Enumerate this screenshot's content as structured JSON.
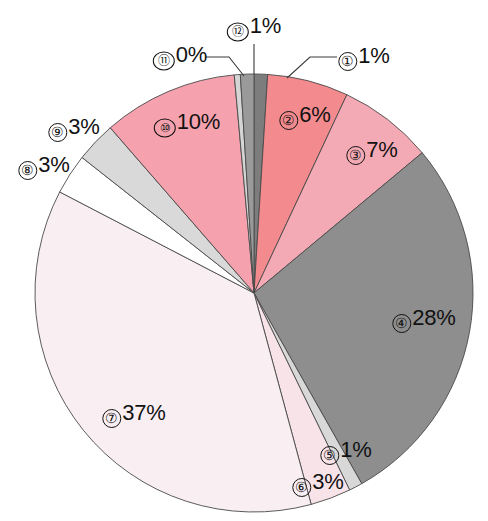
{
  "chart_data": {
    "type": "pie",
    "title": "",
    "subtitle": "",
    "xlabel": "",
    "ylabel": "",
    "legend_position": "none",
    "grid": false,
    "unit": "%",
    "start_angle_deg": -90,
    "direction": "clockwise",
    "categories": [
      "1",
      "2",
      "3",
      "4",
      "5",
      "6",
      "7",
      "8",
      "9",
      "10",
      "11",
      "12"
    ],
    "values": [
      1,
      6,
      7,
      28,
      1,
      3,
      37,
      3,
      3,
      10,
      0,
      1
    ],
    "colors": [
      "#7d7d7d",
      "#f28a8e",
      "#f4aab5",
      "#8e8e8e",
      "#d8d8d8",
      "#f7e3e8",
      "#f9eff2",
      "#ffffff",
      "#d9d9d9",
      "#f5a2ae",
      "#d5d5d5",
      "#9a9a9a"
    ],
    "labels": [
      {
        "id": "1",
        "marker": "①",
        "text": "1%",
        "value": 1
      },
      {
        "id": "2",
        "marker": "②",
        "text": "6%",
        "value": 6
      },
      {
        "id": "3",
        "marker": "③",
        "text": "7%",
        "value": 7
      },
      {
        "id": "4",
        "marker": "④",
        "text": "28%",
        "value": 28
      },
      {
        "id": "5",
        "marker": "⑤",
        "text": "1%",
        "value": 1
      },
      {
        "id": "6",
        "marker": "⑥",
        "text": "3%",
        "value": 3
      },
      {
        "id": "7",
        "marker": "⑦",
        "text": "37%",
        "value": 37
      },
      {
        "id": "8",
        "marker": "⑧",
        "text": "3%",
        "value": 3
      },
      {
        "id": "9",
        "marker": "⑨",
        "text": "3%",
        "value": 3
      },
      {
        "id": "10",
        "marker": "⑩",
        "text": "10%",
        "value": 10
      },
      {
        "id": "11",
        "marker": "⑪",
        "text": "0%",
        "value": 0
      },
      {
        "id": "12",
        "marker": "⑫",
        "text": "1%",
        "value": 1
      }
    ]
  },
  "labels": {
    "l1": {
      "marker": "①",
      "pct": "1%"
    },
    "l2": {
      "marker": "②",
      "pct": "6%"
    },
    "l3": {
      "marker": "③",
      "pct": "7%"
    },
    "l4": {
      "marker": "④",
      "pct": "28%"
    },
    "l5": {
      "marker": "⑤",
      "pct": "1%"
    },
    "l6": {
      "marker": "⑥",
      "pct": "3%"
    },
    "l7": {
      "marker": "⑦",
      "pct": "37%"
    },
    "l8": {
      "marker": "⑧",
      "pct": "3%"
    },
    "l9": {
      "marker": "⑨",
      "pct": "3%"
    },
    "l10": {
      "marker": "⑩",
      "pct": "10%"
    },
    "l11": {
      "marker": "⑪",
      "pct": "0%"
    },
    "l12": {
      "marker": "⑫",
      "pct": "1%"
    }
  }
}
